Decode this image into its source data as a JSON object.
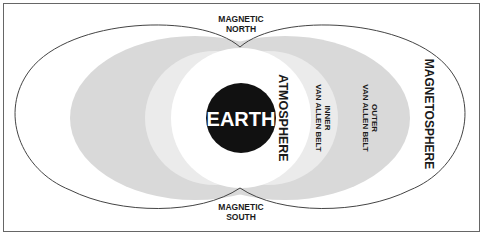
{
  "diagram": {
    "type": "magnetosphere-cross-section",
    "labels": {
      "magnetic_north_line1": "MAGNETIC",
      "magnetic_north_line2": "NORTH",
      "magnetic_south_line1": "MAGNETIC",
      "magnetic_south_line2": "SOUTH",
      "earth": "EARTH",
      "atmosphere": "ATMOSPHERE",
      "inner_belt_line1": "INNER",
      "inner_belt_line2": "VAN ALLEN BELT",
      "outer_belt_line1": "OUTER",
      "outer_belt_line2": "VAN ALLEN BELT",
      "magnetosphere": "MAGNETOSPHERE"
    },
    "colors": {
      "frame": "#555555",
      "outline": "#444444",
      "outer_belt": "#d9d9d9",
      "inner_belt": "#ebebeb",
      "atmosphere": "#ffffff",
      "earth": "#111111",
      "earth_text": "#ffffff"
    }
  }
}
